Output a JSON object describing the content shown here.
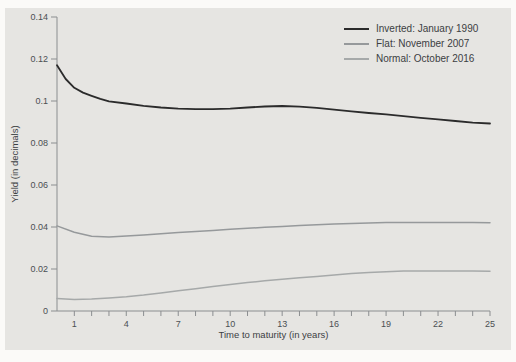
{
  "colors": {
    "page_bg": "#fbfaf8",
    "panel_bg": "#e6e5e2",
    "axis": "#8b8e90",
    "tick_text": "#4b4f52",
    "label_text": "#3c4043"
  },
  "chart_data": {
    "type": "line",
    "title": "",
    "xlabel": "Time to maturity (in years)",
    "ylabel": "Yield (in decimals)",
    "xlim": [
      0,
      25
    ],
    "ylim": [
      0,
      0.14
    ],
    "grid": false,
    "legend_position": "top-right-inside",
    "x_ticks": {
      "values": [
        1,
        4,
        7,
        10,
        13,
        16,
        19,
        22,
        25
      ],
      "labels": [
        "1",
        "4",
        "7",
        "10",
        "13",
        "16",
        "19",
        "22",
        "25"
      ]
    },
    "x_minor_ticks": [
      1,
      2,
      3,
      4,
      5,
      6,
      7,
      8,
      9,
      10,
      11,
      12,
      13,
      14,
      15,
      16,
      17,
      18,
      19,
      20,
      21,
      22,
      23,
      24,
      25
    ],
    "y_ticks": {
      "values": [
        0,
        0.02,
        0.04,
        0.06,
        0.08,
        0.1,
        0.12,
        0.14
      ],
      "labels": [
        "0",
        "0.02",
        "0.04",
        "0.06",
        "0.08",
        "0.1",
        "0.12",
        "0.14"
      ]
    },
    "series": [
      {
        "name": "Inverted: January 1990",
        "color": "#2b2b2b",
        "stroke_width": 1.8,
        "x": [
          0,
          0.5,
          1,
          1.5,
          2,
          2.5,
          3,
          4,
          5,
          6,
          7,
          8,
          9,
          10,
          11,
          12,
          13,
          14,
          15,
          16,
          17,
          18,
          19,
          20,
          21,
          22,
          23,
          24,
          25
        ],
        "values": [
          0.117,
          0.1105,
          0.1063,
          0.104,
          0.1025,
          0.101,
          0.0998,
          0.0988,
          0.0977,
          0.0969,
          0.0964,
          0.0961,
          0.0961,
          0.0964,
          0.0969,
          0.0974,
          0.0976,
          0.0973,
          0.0967,
          0.0959,
          0.0951,
          0.0943,
          0.0936,
          0.0928,
          0.092,
          0.0913,
          0.0905,
          0.0897,
          0.0893
        ]
      },
      {
        "name": "Flat: November 2007",
        "color": "#96999b",
        "stroke_width": 1.5,
        "x": [
          0,
          1,
          2,
          3,
          4,
          5,
          6,
          7,
          8,
          9,
          10,
          11,
          12,
          13,
          14,
          15,
          16,
          17,
          18,
          19,
          20,
          21,
          22,
          23,
          24,
          25
        ],
        "values": [
          0.0405,
          0.0375,
          0.0356,
          0.0353,
          0.0357,
          0.0362,
          0.0368,
          0.0374,
          0.0379,
          0.0384,
          0.0389,
          0.0394,
          0.0399,
          0.0403,
          0.0407,
          0.0411,
          0.0414,
          0.0417,
          0.0419,
          0.0421,
          0.0422,
          0.0422,
          0.0422,
          0.0421,
          0.0421,
          0.042
        ]
      },
      {
        "name": "Normal: October 2016",
        "color": "#a6a9a9",
        "stroke_width": 1.5,
        "x": [
          0,
          1,
          2,
          3,
          4,
          5,
          6,
          7,
          8,
          9,
          10,
          11,
          12,
          13,
          14,
          15,
          16,
          17,
          18,
          19,
          20,
          21,
          22,
          23,
          24,
          25
        ],
        "values": [
          0.006,
          0.0055,
          0.0057,
          0.0062,
          0.0068,
          0.0076,
          0.0086,
          0.0096,
          0.0106,
          0.0116,
          0.0126,
          0.0135,
          0.0144,
          0.0151,
          0.0158,
          0.0165,
          0.0172,
          0.0178,
          0.0183,
          0.0187,
          0.019,
          0.0191,
          0.0191,
          0.019,
          0.019,
          0.0189
        ]
      }
    ]
  }
}
